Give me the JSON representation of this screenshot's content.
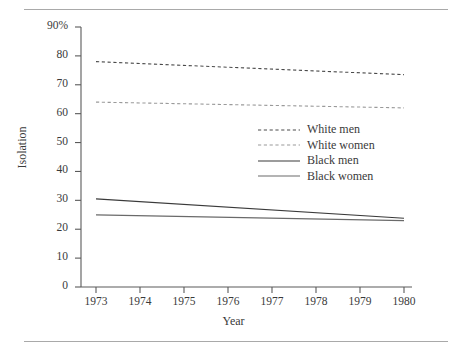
{
  "figure": {
    "rule_top": "horizontal-rule",
    "rule_bottom": "horizontal-rule"
  },
  "chart_data": {
    "type": "line",
    "title": "",
    "xlabel": "Year",
    "ylabel": "Isolation",
    "xlim": [
      1973,
      1980
    ],
    "ylim": [
      0,
      90
    ],
    "grid": false,
    "legend_position": "center",
    "x": [
      1973,
      1980
    ],
    "xticks": [
      "1973",
      "1974",
      "1975",
      "1976",
      "1977",
      "1978",
      "1979",
      "1980"
    ],
    "yticks": [
      "90%",
      "80",
      "70",
      "60",
      "50",
      "40",
      "30",
      "20",
      "10",
      "0"
    ],
    "ytick_values": [
      90,
      80,
      70,
      60,
      50,
      40,
      30,
      20,
      10,
      0
    ],
    "series": [
      {
        "name": "White men",
        "style": "dashed",
        "color": "#4a4a4a",
        "values": [
          78.0,
          73.5
        ]
      },
      {
        "name": "White women",
        "style": "dashed",
        "color": "#9a9a9a",
        "values": [
          64.0,
          62.0
        ]
      },
      {
        "name": "Black men",
        "style": "solid",
        "color": "#3a3a3a",
        "values": [
          30.5,
          23.8
        ]
      },
      {
        "name": "Black women",
        "style": "solid",
        "color": "#6a6a6a",
        "values": [
          25.0,
          23.0
        ]
      }
    ]
  },
  "legend": {
    "items": [
      {
        "label": "White men"
      },
      {
        "label": "White women"
      },
      {
        "label": "Black men"
      },
      {
        "label": "Black women"
      }
    ]
  }
}
